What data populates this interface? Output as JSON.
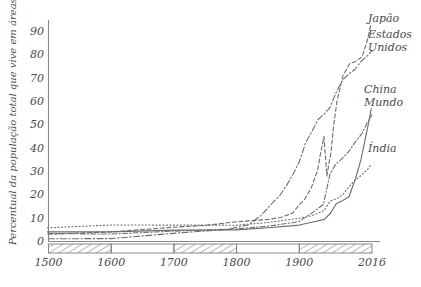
{
  "chart_data": {
    "type": "line",
    "title": "",
    "xlabel": "",
    "ylabel": "Percentual da população total que vive em áreas urbanas",
    "xlim": [
      1500,
      2016
    ],
    "ylim": [
      0,
      95
    ],
    "grid": false,
    "legend_position": "right-inline",
    "xticks": [
      "1500",
      "1600",
      "1700",
      "1800",
      "1900",
      "2016"
    ],
    "xtick_values": [
      1500,
      1600,
      1700,
      1800,
      1900,
      2016
    ],
    "yticks": [
      "0",
      "10",
      "20",
      "30",
      "40",
      "50",
      "60",
      "70",
      "80",
      "90"
    ],
    "ytick_values": [
      0,
      10,
      20,
      30,
      40,
      50,
      60,
      70,
      80,
      90
    ],
    "series": [
      {
        "name": "Japão",
        "style": "dashed",
        "x": [
          1500,
          1600,
          1700,
          1750,
          1800,
          1850,
          1870,
          1890,
          1900,
          1910,
          1920,
          1930,
          1935,
          1940,
          1945,
          1947,
          1950,
          1955,
          1960,
          1970,
          1980,
          1990,
          2000,
          2010,
          2016
        ],
        "values": [
          3,
          4,
          6,
          7,
          8,
          9,
          10,
          12,
          15,
          18,
          23,
          30,
          37,
          45,
          28,
          33,
          38,
          50,
          60,
          71,
          76,
          77,
          79,
          86,
          93
        ]
      },
      {
        "name": "Estados Unidos",
        "style": "dash-dot",
        "x": [
          1500,
          1600,
          1700,
          1750,
          1790,
          1800,
          1820,
          1840,
          1860,
          1870,
          1880,
          1890,
          1900,
          1910,
          1920,
          1930,
          1940,
          1950,
          1960,
          1970,
          1980,
          1990,
          2000,
          2010,
          2016
        ],
        "values": [
          1,
          1,
          3,
          4,
          5,
          6,
          7,
          11,
          17,
          20,
          24,
          29,
          34,
          42,
          47,
          52,
          54,
          57,
          64,
          69,
          72,
          74,
          77,
          80,
          82
        ]
      },
      {
        "name": "China",
        "style": "solid",
        "x": [
          1500,
          1600,
          1700,
          1800,
          1850,
          1900,
          1920,
          1940,
          1950,
          1960,
          1970,
          1980,
          1990,
          2000,
          2010,
          2016
        ],
        "values": [
          4,
          4,
          5,
          5,
          6,
          7,
          8,
          9,
          12,
          16,
          17,
          19,
          26,
          35,
          49,
          57
        ]
      },
      {
        "name": "Mundo",
        "style": "dash-dot",
        "x": [
          1500,
          1600,
          1700,
          1800,
          1850,
          1900,
          1920,
          1940,
          1950,
          1960,
          1970,
          1980,
          1990,
          2000,
          2010,
          2016
        ],
        "values": [
          3,
          3,
          4,
          5,
          6,
          8,
          12,
          16,
          29,
          33,
          36,
          39,
          43,
          46,
          51,
          54
        ]
      },
      {
        "name": "Índia",
        "style": "dotted",
        "x": [
          1500,
          1600,
          1700,
          1800,
          1850,
          1900,
          1920,
          1940,
          1950,
          1960,
          1970,
          1980,
          1990,
          2000,
          2010,
          2016
        ],
        "values": [
          6,
          7,
          7,
          7,
          8,
          10,
          11,
          13,
          17,
          18,
          20,
          23,
          26,
          28,
          31,
          33
        ]
      }
    ],
    "annotations": [
      {
        "label": "Japão",
        "x_px": 368,
        "y_px": 22
      },
      {
        "label": "Estados",
        "x_px": 368,
        "y_px": 38
      },
      {
        "label": "Unidos",
        "x_px": 368,
        "y_px": 51
      },
      {
        "label": "China",
        "x_px": 364,
        "y_px": 93
      },
      {
        "label": "Mundo",
        "x_px": 364,
        "y_px": 106
      },
      {
        "label": "Índia",
        "x_px": 368,
        "y_px": 152
      }
    ],
    "timebar": {
      "description": "alternating hatched and blank century blocks below the x axis",
      "segments": [
        {
          "from": 1500,
          "to": 1600,
          "fill": "hatched"
        },
        {
          "from": 1600,
          "to": 1700,
          "fill": "blank"
        },
        {
          "from": 1700,
          "to": 1800,
          "fill": "hatched"
        },
        {
          "from": 1800,
          "to": 1900,
          "fill": "blank"
        },
        {
          "from": 1900,
          "to": 2016,
          "fill": "hatched"
        }
      ]
    },
    "colors": {
      "ink": "#6d6d6d",
      "text": "#4a4a4a",
      "axis": "#8a8a8a",
      "background": "#ffffff"
    }
  }
}
